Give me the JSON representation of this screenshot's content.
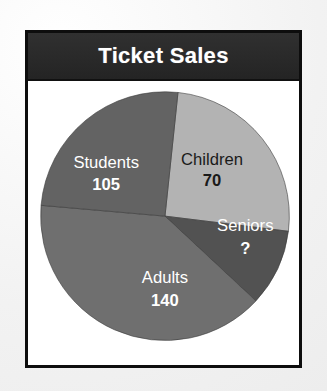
{
  "figure": {
    "title": "Ticket Sales",
    "title_bar_color": "#2a2a2a",
    "title_text_color": "#ffffff",
    "frame_border_color": "#0d0d0d",
    "plot_background": "#ffffff",
    "page_background": "#f2f2f2"
  },
  "chart_data": {
    "type": "pie",
    "title": "Ticket Sales",
    "xlabel": "",
    "ylabel": "",
    "legend": "none",
    "grid": false,
    "labels_inside_slices": true,
    "start_angle_deg": 6,
    "direction": "clockwise",
    "categories": [
      "Children",
      "Seniors",
      "Adults",
      "Students"
    ],
    "values": [
      70,
      null,
      140,
      105
    ],
    "value_labels": [
      "70",
      "?",
      "140",
      "105"
    ],
    "colors": [
      "#b3b3b3",
      "#525252",
      "#6f6f6f",
      "#636363"
    ],
    "text_colors": [
      "#1a1a1a",
      "#ffffff",
      "#ffffff",
      "#ffffff"
    ],
    "slices": [
      {
        "name": "Children",
        "label": "Children",
        "value_label": "70",
        "value": 70,
        "color": "#b3b3b3",
        "text_color": "#1a1a1a",
        "start_deg": 6,
        "end_deg": 97,
        "label_x": 213,
        "label_y": 160,
        "value_x": 213,
        "value_y": 182
      },
      {
        "name": "Seniors",
        "label": "Seniors",
        "value_label": "?",
        "value": null,
        "color": "#525252",
        "text_color": "#ffffff",
        "start_deg": 97,
        "end_deg": 133,
        "label_x": 247,
        "label_y": 228,
        "value_x": 247,
        "value_y": 251
      },
      {
        "name": "Adults",
        "label": "Adults",
        "value_label": "140",
        "value": 140,
        "color": "#6f6f6f",
        "text_color": "#ffffff",
        "start_deg": 133,
        "end_deg": 275,
        "label_x": 165,
        "label_y": 281,
        "value_x": 165,
        "value_y": 304
      },
      {
        "name": "Students",
        "label": "Students",
        "value_label": "105",
        "value": 105,
        "color": "#636363",
        "text_color": "#ffffff",
        "start_deg": 275,
        "end_deg": 366,
        "label_x": 105,
        "label_y": 163,
        "value_x": 105,
        "value_y": 186
      }
    ],
    "geometry": {
      "center_x": 165,
      "center_y": 217,
      "radius": 127
    }
  }
}
